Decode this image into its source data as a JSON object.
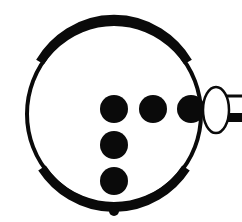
{
  "diagram": {
    "colors": {
      "background": "#ffffff",
      "ink": "#0a0a0a",
      "fill_light": "#ffffff"
    },
    "ring": {
      "cx": 114,
      "cy": 114,
      "rx": 87,
      "ry": 90
    },
    "dots": [
      {
        "id": "dot-row-1",
        "cx": 114,
        "cy": 109,
        "r": 14
      },
      {
        "id": "dot-row-2",
        "cx": 153,
        "cy": 109,
        "r": 14
      },
      {
        "id": "dot-row-3",
        "cx": 191,
        "cy": 109,
        "r": 14
      },
      {
        "id": "dot-col-2",
        "cx": 114,
        "cy": 145,
        "r": 14
      },
      {
        "id": "dot-col-3",
        "cx": 114,
        "cy": 181,
        "r": 14
      }
    ],
    "small_dot": {
      "cx": 114,
      "cy": 211,
      "r": 5
    },
    "connector": {
      "cx": 216,
      "cy": 110,
      "rx": 13,
      "ry": 23
    },
    "tube": {
      "x": 228,
      "top_y": 96,
      "bottom_y": 118,
      "end_x": 242
    }
  }
}
